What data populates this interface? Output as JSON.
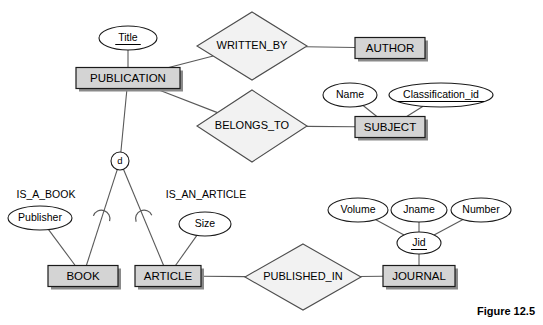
{
  "figure": {
    "caption": "Figure 12.5"
  },
  "entities": [
    {
      "id": "publication",
      "label": "PUBLICATION",
      "x": 128,
      "y": 78,
      "w": 104,
      "h": 21
    },
    {
      "id": "author",
      "label": "AUTHOR",
      "x": 390,
      "y": 48,
      "w": 70,
      "h": 21
    },
    {
      "id": "subject",
      "label": "SUBJECT",
      "x": 390,
      "y": 127,
      "w": 70,
      "h": 21
    },
    {
      "id": "book",
      "label": "BOOK",
      "x": 83,
      "y": 276,
      "w": 70,
      "h": 21
    },
    {
      "id": "article",
      "label": "ARTICLE",
      "x": 168,
      "y": 276,
      "w": 66,
      "h": 21
    },
    {
      "id": "journal",
      "label": "JOURNAL",
      "x": 419,
      "y": 276,
      "w": 72,
      "h": 21
    }
  ],
  "relationships": [
    {
      "id": "written-by",
      "label": "WRITTEN_BY",
      "x": 252,
      "y": 46,
      "rx": 55,
      "ry": 34
    },
    {
      "id": "belongs-to",
      "label": "BELONGS_TO",
      "x": 252,
      "y": 126,
      "rx": 55,
      "ry": 36
    },
    {
      "id": "published-in",
      "label": "PUBLISHED_IN",
      "x": 303,
      "y": 277,
      "rx": 58,
      "ry": 33
    }
  ],
  "attributes": [
    {
      "id": "title",
      "label": "Title",
      "x": 128,
      "y": 38,
      "rx": 29,
      "ry": 12,
      "key": true
    },
    {
      "id": "name",
      "label": "Name",
      "x": 350,
      "y": 95,
      "rx": 27,
      "ry": 12,
      "key": false
    },
    {
      "id": "classification-id",
      "label": "Classification_id",
      "x": 441,
      "y": 95,
      "rx": 52,
      "ry": 12,
      "key": true
    },
    {
      "id": "publisher",
      "label": "Publisher",
      "x": 40,
      "y": 218,
      "rx": 32,
      "ry": 12,
      "key": false
    },
    {
      "id": "size",
      "label": "Size",
      "x": 205,
      "y": 224,
      "rx": 26,
      "ry": 12,
      "key": false
    },
    {
      "id": "volume",
      "label": "Volume",
      "x": 358,
      "y": 210,
      "rx": 30,
      "ry": 12,
      "key": false
    },
    {
      "id": "jname",
      "label": "Jname",
      "x": 419,
      "y": 210,
      "rx": 28,
      "ry": 12,
      "key": false
    },
    {
      "id": "number",
      "label": "Number",
      "x": 481,
      "y": 210,
      "rx": 30,
      "ry": 12,
      "key": false
    },
    {
      "id": "jid",
      "label": "Jid",
      "x": 419,
      "y": 243,
      "rx": 22,
      "ry": 11,
      "key": true
    }
  ],
  "specialization": {
    "id": "disjoint-d",
    "label": "d",
    "x": 120,
    "y": 161,
    "r": 9
  },
  "isa_labels": [
    {
      "id": "is-a-book",
      "label": "IS_A_BOOK",
      "x": 46,
      "y": 195
    },
    {
      "id": "is-an-article",
      "label": "IS_AN_ARTICLE",
      "x": 206,
      "y": 195
    }
  ],
  "connectors": [
    {
      "id": "title-publication",
      "from": "title",
      "to": "publication"
    },
    {
      "id": "publication-written-by",
      "from": "publication",
      "to": "written-by"
    },
    {
      "id": "publication-belongs-to",
      "from": "publication",
      "to": "belongs-to"
    },
    {
      "id": "written-by-author",
      "from": "written-by",
      "to": "author"
    },
    {
      "id": "belongs-to-subject",
      "from": "belongs-to",
      "to": "subject"
    },
    {
      "id": "name-subject",
      "from": "name",
      "to": "subject"
    },
    {
      "id": "classification-subject",
      "from": "classification-id",
      "to": "subject"
    },
    {
      "id": "publication-disjoint",
      "from": "publication",
      "to": "disjoint-d"
    },
    {
      "id": "disjoint-book",
      "from": "disjoint-d",
      "to": "book"
    },
    {
      "id": "disjoint-article",
      "from": "disjoint-d",
      "to": "article"
    },
    {
      "id": "publisher-book",
      "from": "publisher",
      "to": "book"
    },
    {
      "id": "size-article",
      "from": "size",
      "to": "article"
    },
    {
      "id": "article-published-in",
      "from": "article",
      "to": "published-in"
    },
    {
      "id": "published-in-journal",
      "from": "published-in",
      "to": "journal"
    },
    {
      "id": "volume-jid",
      "from": "volume",
      "to": "jid"
    },
    {
      "id": "jname-jid",
      "from": "jname",
      "to": "jid"
    },
    {
      "id": "number-jid",
      "from": "number",
      "to": "jid"
    },
    {
      "id": "jid-journal",
      "from": "jid",
      "to": "journal"
    }
  ],
  "colors": {
    "entity_fill": "#d4d4d4",
    "relationship_fill": "#f2f2f2",
    "attribute_fill": "#ffffff",
    "line": "#595959",
    "text": "#000000",
    "background": "#ffffff"
  }
}
